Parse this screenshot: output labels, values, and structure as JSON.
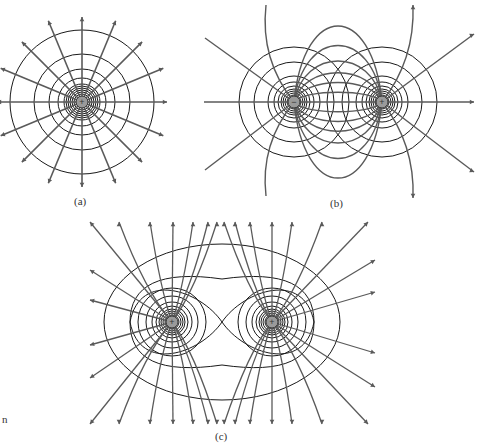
{
  "figure": {
    "panels": [
      {
        "id": "a",
        "label": "(a)",
        "description": "Field lines and equipotentials of a single positive point charge",
        "charges": [
          {
            "sign": "+",
            "x": 82,
            "y": 102
          }
        ]
      },
      {
        "id": "b",
        "label": "(b)",
        "description": "Electric dipole: negative and positive charges",
        "charges": [
          {
            "sign": "-",
            "x": 294,
            "y": 102
          },
          {
            "sign": "+",
            "x": 382,
            "y": 102
          }
        ]
      },
      {
        "id": "c",
        "label": "(c)",
        "description": "Two equal positive charges",
        "charges": [
          {
            "sign": "+",
            "x": 172,
            "y": 322
          },
          {
            "sign": "+",
            "x": 272,
            "y": 322
          }
        ]
      }
    ],
    "margin_text": "n",
    "colors": {
      "field_line": "#5a5a5a",
      "equipotential": "#1a1a1a",
      "charge_fill": "#9a9a9a"
    }
  }
}
